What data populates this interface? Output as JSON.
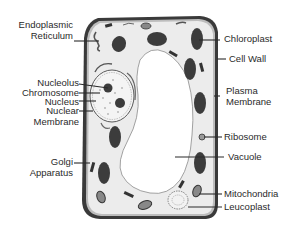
{
  "diagram": {
    "labels_left": [
      {
        "id": "endoplasmic-reticulum",
        "line1": "Endoplasmic",
        "line2": "Reticulum"
      },
      {
        "id": "nucleolus",
        "line1": "Nucleolus"
      },
      {
        "id": "chromosome",
        "line1": "Chromosome"
      },
      {
        "id": "nucleus",
        "line1": "Nucleus"
      },
      {
        "id": "nuclear-membrane",
        "line1": "Nuclear",
        "line2": "Membrane"
      },
      {
        "id": "golgi-apparatus",
        "line1": "Golgi",
        "line2": "Apparatus"
      }
    ],
    "labels_right": [
      {
        "id": "chloroplast",
        "line1": "Chloroplast"
      },
      {
        "id": "cell-wall",
        "line1": "Cell Wall"
      },
      {
        "id": "plasma-membrane",
        "line1": "Plasma",
        "line2": "Membrane"
      },
      {
        "id": "ribosome",
        "line1": "Ribosome"
      },
      {
        "id": "vacuole",
        "line1": "Vacuole"
      },
      {
        "id": "mitochondria",
        "line1": "Mitochondria"
      },
      {
        "id": "leucoplast",
        "line1": "Leucoplast"
      }
    ],
    "colors": {
      "cell_wall": "#3a3a3a",
      "cytoplasm": "#ececec",
      "vacuole": "#ffffff",
      "organelle_dark": "#3c3c3c",
      "label_text": "#2a2a2a"
    }
  }
}
